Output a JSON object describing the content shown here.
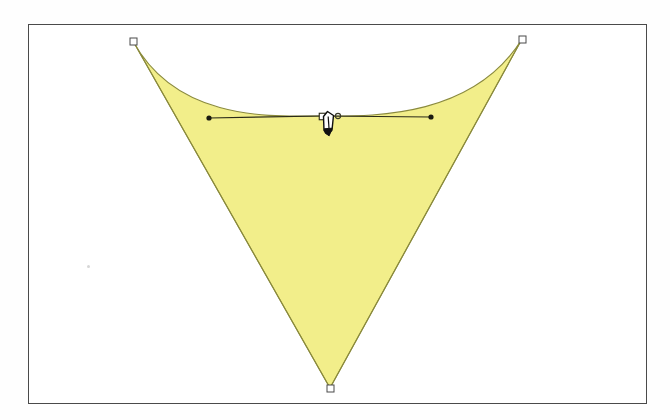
{
  "app": {
    "title": "Vector Drawing Canvas",
    "tool_in_use": "pen-tool",
    "document_mode": "path-editing"
  },
  "canvas": {
    "name": "artboard",
    "background_color": "#ffffff",
    "border_color": "#4a4a4a",
    "x": 28,
    "y": 24,
    "width": 619,
    "height": 380
  },
  "shape": {
    "name": "concave-triangle-path",
    "description": "Three-point closed path with a concave (inward curving) top edge forming a downward arrowhead",
    "fill_color": "#f2ee8a",
    "stroke_color": "#8a8a3c",
    "stroke_width": 1,
    "closed": true,
    "anchors": [
      {
        "id": "anchor-top-left",
        "label": "Top-left anchor",
        "x": 133,
        "y": 41,
        "selected": false,
        "type": "corner"
      },
      {
        "id": "anchor-top-right",
        "label": "Top-right anchor",
        "x": 522,
        "y": 39,
        "selected": false,
        "type": "corner"
      },
      {
        "id": "anchor-bottom",
        "label": "Bottom anchor",
        "x": 330,
        "y": 388,
        "selected": false,
        "type": "corner"
      },
      {
        "id": "anchor-mid-top",
        "label": "Top-edge anchor",
        "x": 322,
        "y": 116,
        "selected": true,
        "type": "smooth"
      }
    ],
    "control_handle": {
      "name": "bezier-handle",
      "anchor_x": 322,
      "anchor_y": 116,
      "left_x": 209,
      "left_y": 118,
      "right_x": 431,
      "right_y": 117,
      "line_color": "#2a2a18",
      "dot_color": "#1a1a10"
    }
  },
  "cursor": {
    "name": "pen-tool-cursor",
    "icon": "pen-nib-icon",
    "x": 322,
    "y": 114,
    "body_color": "#ffffff",
    "outline_color": "#101010",
    "tip_color": "#101010"
  },
  "artifacts": {
    "scan_speck_label": "scan speck"
  }
}
